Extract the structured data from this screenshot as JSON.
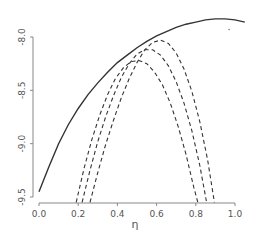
{
  "chart_data": {
    "type": "line",
    "title": "",
    "xlabel": "η",
    "ylabel": "",
    "xlim": [
      -0.05,
      1.08
    ],
    "ylim": [
      -9.55,
      -7.75
    ],
    "xticks": [
      "0.0",
      "0.2",
      "0.4",
      "0.6",
      "0.8",
      "1.0"
    ],
    "xtick_values": [
      0.0,
      0.2,
      0.4,
      0.6,
      0.8,
      1.0
    ],
    "yticks": [
      "-8.0",
      "-8.5",
      "-9.0",
      "-9.5"
    ],
    "ytick_values": [
      -8.0,
      -8.5,
      -9.0,
      -9.5
    ],
    "grid": false,
    "series": [
      {
        "name": "solid",
        "style": "solid",
        "color": "#333333",
        "x": [
          0.0,
          0.05,
          0.1,
          0.15,
          0.2,
          0.25,
          0.3,
          0.35,
          0.4,
          0.45,
          0.5,
          0.55,
          0.6,
          0.65,
          0.7,
          0.75,
          0.8,
          0.85,
          0.9,
          0.95,
          1.0,
          1.05
        ],
        "y": [
          -9.45,
          -9.22,
          -9.0,
          -8.82,
          -8.67,
          -8.54,
          -8.43,
          -8.33,
          -8.24,
          -8.17,
          -8.1,
          -8.04,
          -7.99,
          -7.95,
          -7.91,
          -7.88,
          -7.86,
          -7.84,
          -7.83,
          -7.83,
          -7.84,
          -7.86
        ]
      },
      {
        "name": "dashed-1",
        "style": "dashed",
        "color": "#333333",
        "x": [
          0.19,
          0.23,
          0.27,
          0.31,
          0.35,
          0.39,
          0.43,
          0.47,
          0.51,
          0.55,
          0.59,
          0.63,
          0.67,
          0.71,
          0.75,
          0.79,
          0.81
        ],
        "y": [
          -9.55,
          -9.23,
          -8.96,
          -8.73,
          -8.54,
          -8.39,
          -8.29,
          -8.23,
          -8.22,
          -8.25,
          -8.33,
          -8.45,
          -8.62,
          -8.84,
          -9.1,
          -9.41,
          -9.55
        ]
      },
      {
        "name": "dashed-2",
        "style": "dashed",
        "color": "#333333",
        "x": [
          0.22,
          0.26,
          0.3,
          0.34,
          0.38,
          0.42,
          0.46,
          0.5,
          0.54,
          0.58,
          0.62,
          0.66,
          0.7,
          0.74,
          0.78,
          0.82,
          0.855
        ],
        "y": [
          -9.55,
          -9.25,
          -8.98,
          -8.75,
          -8.55,
          -8.38,
          -8.25,
          -8.16,
          -8.12,
          -8.12,
          -8.17,
          -8.27,
          -8.42,
          -8.62,
          -8.88,
          -9.2,
          -9.55
        ]
      },
      {
        "name": "dashed-3",
        "style": "dashed",
        "color": "#333333",
        "x": [
          0.26,
          0.3,
          0.34,
          0.38,
          0.42,
          0.46,
          0.5,
          0.54,
          0.58,
          0.62,
          0.66,
          0.7,
          0.74,
          0.78,
          0.82,
          0.86,
          0.895
        ],
        "y": [
          -9.55,
          -9.27,
          -9.01,
          -8.78,
          -8.57,
          -8.39,
          -8.24,
          -8.12,
          -8.05,
          -8.03,
          -8.06,
          -8.15,
          -8.3,
          -8.51,
          -8.79,
          -9.15,
          -9.55
        ]
      }
    ],
    "annotations": [
      {
        "type": "point",
        "x": 0.97,
        "y": -7.93
      }
    ]
  }
}
